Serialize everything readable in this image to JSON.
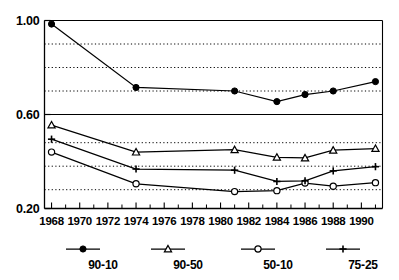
{
  "chart_data": {
    "type": "line",
    "title": "",
    "subtitle": "",
    "xlabel": "",
    "ylabel": "",
    "xlim": [
      1967.5,
      1991.5
    ],
    "ylim": [
      0.2,
      1.0
    ],
    "grid": true,
    "grid_style": "dotted-horizontal",
    "y_ticks_labeled": [
      "1.00",
      "0.60",
      "0.20"
    ],
    "y_tick_values": [
      1.0,
      0.6,
      0.2
    ],
    "y_gridlines": [
      0.9,
      0.8,
      0.7,
      0.48,
      0.38,
      0.28
    ],
    "y_solid_line": 0.6,
    "x_ticks_labeled": [
      "1968",
      "1970",
      "1972",
      "1974",
      "1976",
      "1978",
      "1980",
      "1982",
      "1984",
      "1986",
      "1988",
      "1990"
    ],
    "x_tick_values": [
      1968,
      1970,
      1972,
      1974,
      1976,
      1978,
      1980,
      1982,
      1984,
      1986,
      1988,
      1990
    ],
    "x_minor_ticks": [
      1969,
      1971,
      1973,
      1975,
      1977,
      1979,
      1981,
      1983,
      1985,
      1987,
      1989,
      1991
    ],
    "x": [
      1968,
      1974,
      1981,
      1984,
      1986,
      1988,
      1991
    ],
    "legend_position": "bottom",
    "series": [
      {
        "name": "90-10",
        "marker": "filled-circle",
        "color": "#000000",
        "values": [
          0.985,
          0.715,
          0.7,
          0.655,
          0.685,
          0.7,
          0.74
        ]
      },
      {
        "name": "90-50",
        "marker": "open-triangle",
        "color": "#000000",
        "values": [
          0.555,
          0.44,
          0.45,
          0.418,
          0.415,
          0.448,
          0.455
        ]
      },
      {
        "name": "50-10",
        "marker": "open-circle",
        "color": "#000000",
        "values": [
          0.44,
          0.305,
          0.272,
          0.276,
          0.308,
          0.295,
          0.31
        ]
      },
      {
        "name": "75-25",
        "marker": "plus",
        "color": "#000000",
        "values": [
          0.495,
          0.368,
          0.363,
          0.315,
          0.318,
          0.36,
          0.378
        ]
      }
    ]
  },
  "legend": {
    "items": [
      {
        "label": "90-10",
        "marker": "filled-circle"
      },
      {
        "label": "90-50",
        "marker": "open-triangle"
      },
      {
        "label": "50-10",
        "marker": "open-circle"
      },
      {
        "label": "75-25",
        "marker": "plus"
      }
    ]
  },
  "axes": {
    "y_label_top": "1.00",
    "y_label_mid": "0.60",
    "y_label_bottom": "0.20"
  }
}
